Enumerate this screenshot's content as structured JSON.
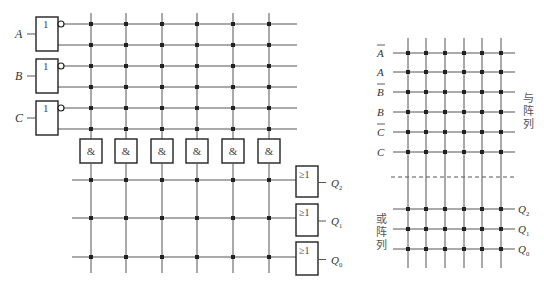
{
  "left_diagram": {
    "inputs": [
      {
        "name": "A",
        "gate_label": "1"
      },
      {
        "name": "B",
        "gate_label": "1"
      },
      {
        "name": "C",
        "gate_label": "1"
      }
    ],
    "and_gates": [
      "&",
      "&",
      "&",
      "&",
      "&",
      "&"
    ],
    "or_gates": [
      {
        "label": "≥1",
        "output": "Q",
        "subscript": "2"
      },
      {
        "label": "≥1",
        "output": "Q",
        "subscript": "1"
      },
      {
        "label": "≥1",
        "output": "Q",
        "subscript": "0"
      }
    ]
  },
  "right_diagram": {
    "and_rows": [
      {
        "name": "A",
        "overline": true
      },
      {
        "name": "A",
        "overline": false
      },
      {
        "name": "B",
        "overline": true
      },
      {
        "name": "B",
        "overline": false
      },
      {
        "name": "C",
        "overline": true
      },
      {
        "name": "C",
        "overline": false
      }
    ],
    "and_array_label": [
      "与",
      "阵",
      "列"
    ],
    "or_array_label": [
      "或",
      "阵",
      "列"
    ],
    "outputs": [
      {
        "name": "Q",
        "subscript": "2"
      },
      {
        "name": "Q",
        "subscript": "1"
      },
      {
        "name": "Q",
        "subscript": "0"
      }
    ],
    "column_count": 6
  },
  "colors": {
    "line": "#555555",
    "dot": "#222222",
    "box": "#222222"
  }
}
